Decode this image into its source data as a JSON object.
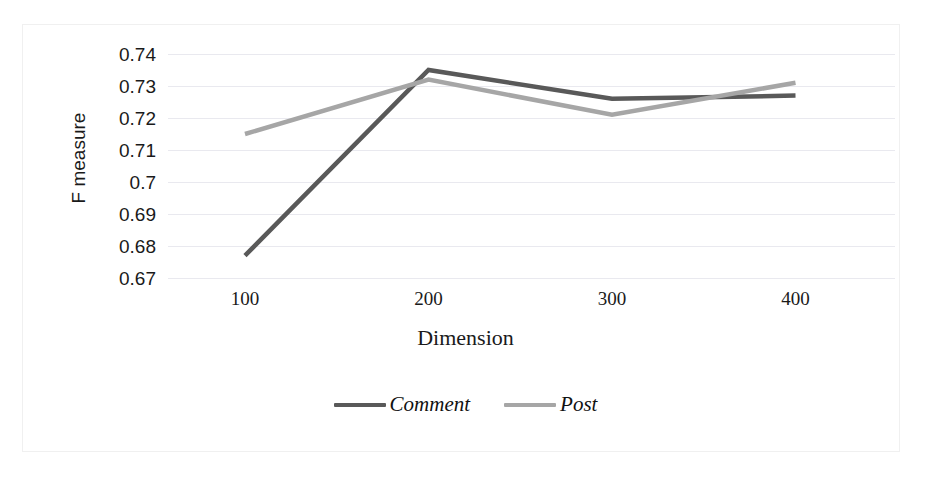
{
  "chart_data": {
    "type": "line",
    "title": "",
    "xlabel": "Dimension",
    "ylabel": "F measure",
    "categories": [
      100,
      200,
      300,
      400
    ],
    "x_tick_labels": [
      "100",
      "200",
      "300",
      "400"
    ],
    "y_tick_labels": [
      "0.74",
      "0.73",
      "0.72",
      "0.71",
      "0.7",
      "0.69",
      "0.68",
      "0.67"
    ],
    "y_tick_values": [
      0.74,
      0.73,
      0.72,
      0.71,
      0.7,
      0.69,
      0.68,
      0.67
    ],
    "ylim": [
      0.67,
      0.74
    ],
    "xlim": [
      100,
      400
    ],
    "grid": true,
    "grid_axis": "y",
    "legend_position": "bottom-center",
    "series": [
      {
        "name": "Comment",
        "color": "#595959",
        "values": [
          0.677,
          0.735,
          0.726,
          0.727
        ]
      },
      {
        "name": "Post",
        "color": "#a6a6a6",
        "values": [
          0.715,
          0.732,
          0.721,
          0.731
        ]
      }
    ]
  },
  "legend": {
    "entries": [
      {
        "label": "Comment",
        "color": "#595959"
      },
      {
        "label": "Post",
        "color": "#a6a6a6"
      }
    ]
  },
  "colors": {
    "comment_line": "#595959",
    "post_line": "#a6a6a6",
    "gridline": "#e9e9ef",
    "frame": "#f0f0f0",
    "text": "#1a1a1a"
  }
}
